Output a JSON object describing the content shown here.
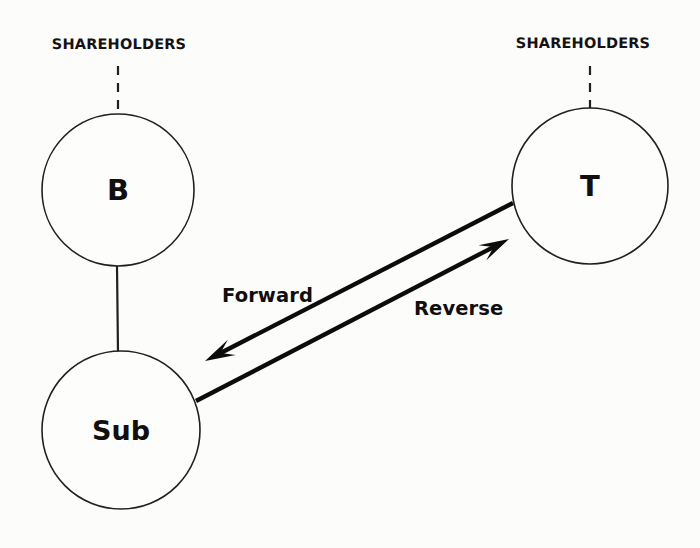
{
  "diagram": {
    "background_color": "#fcfcfb",
    "line_color": "#221f1f",
    "arrow_color": "#0d0c0c",
    "text_color": "#120f0f",
    "nodes": [
      {
        "id": "b",
        "label": "B",
        "cx": 118,
        "cy": 190,
        "r": 76,
        "label_size": "size-big"
      },
      {
        "id": "t",
        "label": "T",
        "cx": 590,
        "cy": 186,
        "r": 78,
        "label_size": "size-big"
      },
      {
        "id": "sub",
        "label": "Sub",
        "cx": 121,
        "cy": 430,
        "r": 79,
        "label_size": "size-med"
      }
    ],
    "shareholder_labels": [
      {
        "id": "b-shareholders",
        "text": "SHAREHOLDERS",
        "x": 119,
        "y": 37
      },
      {
        "id": "t-shareholders",
        "text": "SHAREHOLDERS",
        "x": 583,
        "y": 36
      }
    ],
    "dashed_connectors": [
      {
        "id": "b-shareholders-link",
        "x1": 118,
        "y1": 66,
        "x2": 118,
        "y2": 113
      },
      {
        "id": "t-shareholders-link",
        "x1": 590,
        "y1": 66,
        "x2": 590,
        "y2": 109
      }
    ],
    "solid_connectors": [
      {
        "id": "b-sub-link",
        "x1": 117,
        "y1": 266,
        "x2": 118,
        "y2": 353
      }
    ],
    "flow_arrows": [
      {
        "id": "forward-arrow",
        "label": "Forward",
        "from": "T",
        "to": "Sub",
        "x1": 513,
        "y1": 203,
        "x2": 205,
        "y2": 361,
        "label_x": 222,
        "label_y": 284
      },
      {
        "id": "reverse-arrow",
        "label": "Reverse",
        "from": "Sub",
        "to": "T",
        "x1": 196,
        "y1": 401,
        "x2": 509,
        "y2": 239,
        "label_x": 414,
        "label_y": 297
      }
    ]
  }
}
